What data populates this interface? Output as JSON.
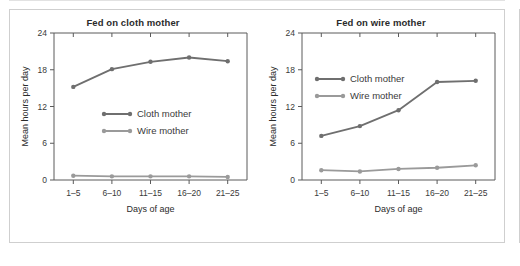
{
  "figure": {
    "panel_count": 2,
    "line_color_cloth": "#6f6f6f",
    "line_color_wire": "#9a9a9a",
    "axis_color": "#5a5a5a",
    "frame_color": "#cfcfcf"
  },
  "chart_data": [
    {
      "type": "line",
      "title": "Fed on cloth mother",
      "xlabel": "Days of age",
      "ylabel": "Mean hours per day",
      "categories": [
        "1–5",
        "6–10",
        "11–15",
        "16–20",
        "21–25"
      ],
      "yticks": [
        0,
        6,
        12,
        18,
        24
      ],
      "ylim": [
        0,
        24
      ],
      "grid": false,
      "legend_position": "inside-center-left",
      "series": [
        {
          "name": "Cloth mother",
          "values": [
            15.2,
            18.1,
            19.3,
            20.0,
            19.4
          ],
          "color": "#6f6f6f"
        },
        {
          "name": "Wire mother",
          "values": [
            0.7,
            0.6,
            0.6,
            0.6,
            0.5
          ],
          "color": "#9a9a9a"
        }
      ]
    },
    {
      "type": "line",
      "title": "Fed on wire mother",
      "xlabel": "Days of age",
      "ylabel": "Mean hours per day",
      "categories": [
        "1–5",
        "6–10",
        "11–15",
        "16–20",
        "21–25"
      ],
      "yticks": [
        0,
        6,
        12,
        18,
        24
      ],
      "ylim": [
        0,
        24
      ],
      "grid": false,
      "legend_position": "inside-upper-left",
      "series": [
        {
          "name": "Cloth mother",
          "values": [
            7.2,
            8.8,
            11.4,
            16.0,
            16.2
          ],
          "color": "#6f6f6f"
        },
        {
          "name": "Wire mother",
          "values": [
            1.6,
            1.4,
            1.8,
            2.0,
            2.4
          ],
          "color": "#9a9a9a"
        }
      ]
    }
  ]
}
